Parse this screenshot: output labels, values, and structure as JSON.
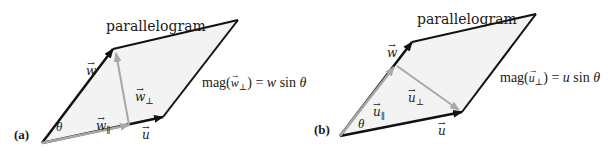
{
  "panels": [
    {
      "id": "a",
      "label": "(a)",
      "title": "parallelogram",
      "vector_w": "w",
      "vector_u": "u",
      "component_parallel": "w",
      "component_parallel_sub": "∥",
      "component_perp": "w",
      "component_perp_sub": "⊥",
      "angle": "θ",
      "equation": {
        "prefix": "mag(",
        "vec": "w",
        "sub": "⊥",
        "suffix": ") = ",
        "rhs_var": "w",
        "rhs_func": " sin ",
        "rhs_angle": "θ"
      },
      "geometry": {
        "origin": [
          42,
          143
        ],
        "w_tip": [
          113,
          49
        ],
        "u_tip": [
          163,
          117
        ],
        "far": [
          238,
          20
        ],
        "proj_foot": [
          129,
          125
        ]
      }
    },
    {
      "id": "b",
      "label": "(b)",
      "title": "parallelogram",
      "vector_w": "w",
      "vector_u": "u",
      "component_parallel": "u",
      "component_parallel_sub": "∥",
      "component_perp": "u",
      "component_perp_sub": "⊥",
      "angle": "θ",
      "equation": {
        "prefix": "mag(",
        "vec": "u",
        "sub": "⊥",
        "suffix": ") = ",
        "rhs_var": "u",
        "rhs_func": " sin ",
        "rhs_angle": "θ"
      },
      "geometry": {
        "origin": [
          340,
          136
        ],
        "w_tip": [
          412,
          42
        ],
        "u_tip": [
          462,
          112
        ],
        "far": [
          536,
          14
        ],
        "proj_foot": [
          393,
          67
        ]
      }
    }
  ],
  "colors": {
    "vector": "#111111",
    "component": "#a8a8a8",
    "fill": "#f3f3f3",
    "text": "#1a1a1a"
  },
  "arrow_glyph": "→"
}
